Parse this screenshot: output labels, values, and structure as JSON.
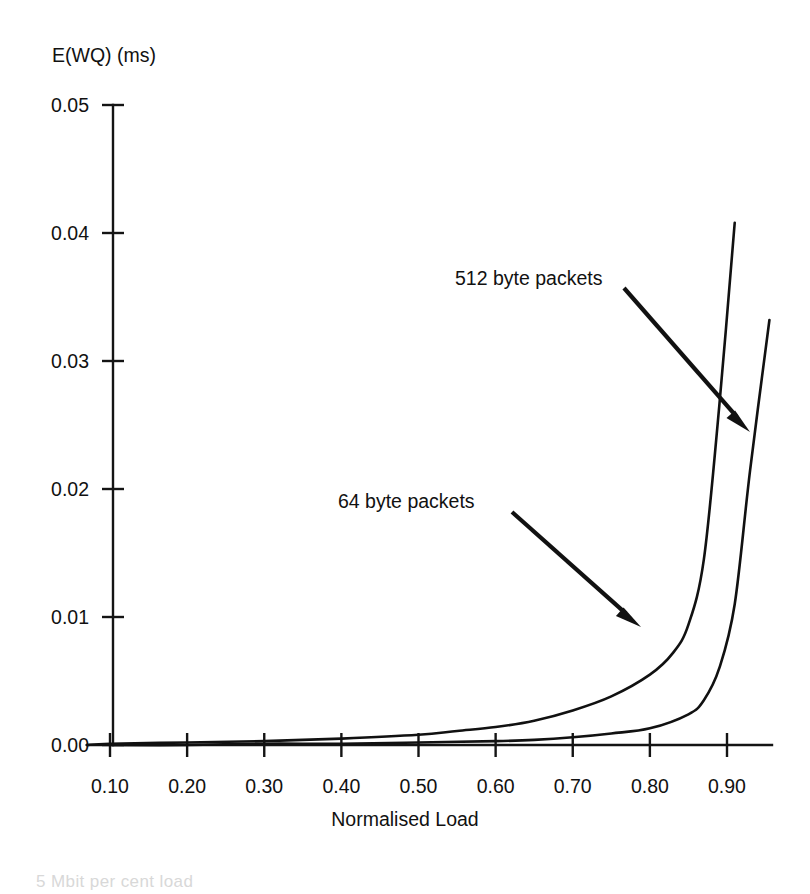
{
  "chart_data": {
    "type": "line",
    "title": "",
    "xlabel": "Normalised Load",
    "ylabel": "E(WQ) (ms)",
    "xlim": [
      0.05,
      0.96
    ],
    "ylim": [
      0.0,
      0.05
    ],
    "grid": false,
    "legend_position": "inline-annotations",
    "x_ticks": [
      "0.10",
      "0.20",
      "0.30",
      "0.40",
      "0.50",
      "0.60",
      "0.70",
      "0.80",
      "0.90"
    ],
    "x_tick_values": [
      0.1,
      0.2,
      0.3,
      0.4,
      0.5,
      0.6,
      0.7,
      0.8,
      0.9
    ],
    "y_ticks": [
      "0.00",
      "0.01",
      "0.02",
      "0.03",
      "0.04",
      "0.05"
    ],
    "y_tick_values": [
      0.0,
      0.01,
      0.02,
      0.03,
      0.04,
      0.05
    ],
    "series": [
      {
        "name": "64 byte packets",
        "x": [
          0.07,
          0.1,
          0.2,
          0.3,
          0.4,
          0.5,
          0.55,
          0.6,
          0.65,
          0.7,
          0.75,
          0.8,
          0.83,
          0.85,
          0.87,
          0.89,
          0.91
        ],
        "values": [
          0.0,
          0.0001,
          0.0002,
          0.0003,
          0.0005,
          0.0008,
          0.0011,
          0.0014,
          0.0019,
          0.0027,
          0.0038,
          0.0055,
          0.0072,
          0.0094,
          0.0145,
          0.0265,
          0.0408
        ]
      },
      {
        "name": "512 byte packets",
        "x": [
          0.07,
          0.1,
          0.2,
          0.3,
          0.4,
          0.5,
          0.6,
          0.65,
          0.7,
          0.75,
          0.8,
          0.85,
          0.87,
          0.89,
          0.91,
          0.93,
          0.955
        ],
        "values": [
          0.0,
          0.0,
          0.0,
          0.0001,
          0.0001,
          0.0002,
          0.0003,
          0.0004,
          0.0006,
          0.0009,
          0.0013,
          0.0024,
          0.0035,
          0.006,
          0.011,
          0.0215,
          0.0332
        ]
      }
    ],
    "annotations": [
      {
        "label": "512 byte packets",
        "label_x": 455,
        "label_y": 285,
        "leader_from": [
          624,
          288
        ],
        "leader_to": [
          750,
          432
        ]
      },
      {
        "label": "64 byte packets",
        "label_x": 338,
        "label_y": 508,
        "leader_from": [
          512,
          512
        ],
        "leader_to": [
          641,
          627
        ]
      }
    ]
  },
  "figure": {
    "y_axis_title": "E(WQ) (ms)",
    "x_axis_title": "Normalised Load",
    "caption_partial": "5 Mbit per cent load"
  },
  "colors": {
    "background": "#ffffff",
    "ink": "#111111",
    "axis": "#141414"
  }
}
